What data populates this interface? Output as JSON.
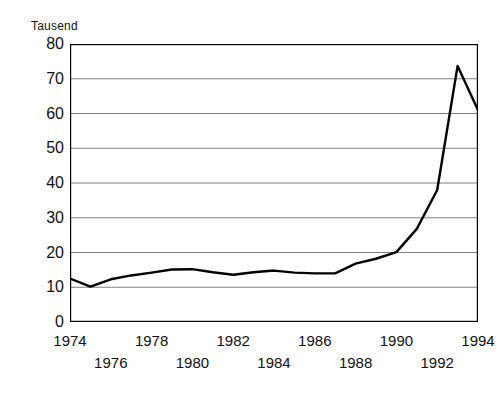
{
  "chart_data": {
    "type": "line",
    "title": "",
    "subtitle": "",
    "unit_label": "Tausend",
    "xlabel": "",
    "ylabel": "",
    "xlim": [
      1974,
      1994
    ],
    "ylim": [
      0,
      80
    ],
    "grid": "horizontal",
    "legend": "none",
    "line_color": "#000000",
    "frame_color": "#000000",
    "gridline_color": "#808080",
    "y_ticks": [
      80,
      70,
      60,
      50,
      40,
      30,
      20,
      10,
      0
    ],
    "y_tick_labels": [
      "80",
      "70",
      "60",
      "50",
      "40",
      "30",
      "20",
      "10",
      "0"
    ],
    "x_ticks": [
      1974,
      1975,
      1976,
      1977,
      1978,
      1979,
      1980,
      1981,
      1982,
      1983,
      1984,
      1985,
      1986,
      1987,
      1988,
      1989,
      1990,
      1991,
      1992,
      1993,
      1994
    ],
    "x_tick_labels_top": [
      "1974",
      "1978",
      "1982",
      "1986",
      "1990",
      "1994"
    ],
    "x_tick_labels_bottom": [
      "1976",
      "1980",
      "1984",
      "1988",
      "1992"
    ],
    "x_tick_values_top": [
      1974,
      1978,
      1982,
      1986,
      1990,
      1994
    ],
    "x_tick_values_bottom": [
      1976,
      1980,
      1984,
      1988,
      1992
    ],
    "x": [
      1974,
      1975,
      1976,
      1977,
      1978,
      1979,
      1980,
      1981,
      1982,
      1983,
      1984,
      1985,
      1986,
      1987,
      1988,
      1989,
      1990,
      1991,
      1992,
      1993,
      1994
    ],
    "values": [
      12.5,
      10.2,
      12.3,
      13.4,
      14.2,
      15.1,
      15.2,
      14.3,
      13.6,
      14.3,
      14.8,
      14.2,
      14.0,
      14.0,
      16.8,
      18.2,
      20.1,
      26.8,
      38.0,
      73.7,
      61.0
    ],
    "series": [
      {
        "name": "",
        "values": [
          12.5,
          10.2,
          12.3,
          13.4,
          14.2,
          15.1,
          15.2,
          14.3,
          13.6,
          14.3,
          14.8,
          14.2,
          14.0,
          14.0,
          16.8,
          18.2,
          20.1,
          26.8,
          38.0,
          73.7,
          61.0
        ]
      }
    ],
    "annotations": []
  }
}
